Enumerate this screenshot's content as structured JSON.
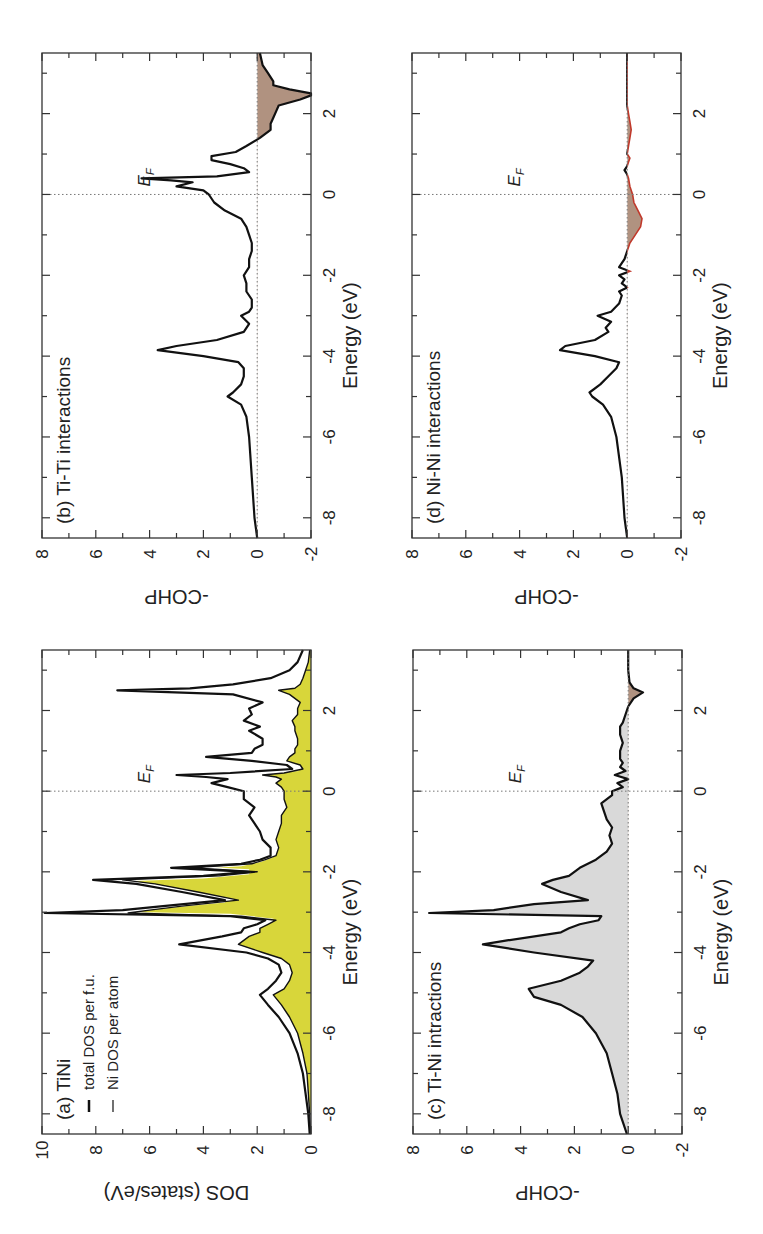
{
  "figure": {
    "colors": {
      "ni_dos_fill": "#d8d63a",
      "tini_cohp_fill": "#d9d9d9",
      "antibonding_fill": "#b09280",
      "antibonding_edge_d": "#c0392b",
      "line": "#111111"
    }
  },
  "chart_data": [
    {
      "id": "a",
      "type": "area",
      "title": "(a) TiNi",
      "xlabel": "Energy (eV)",
      "ylabel": "DOS (states/eV)",
      "xlim": [
        -8.5,
        3.5
      ],
      "ylim": [
        0,
        10
      ],
      "xticks": [
        "-8",
        "-6",
        "-4",
        "-2",
        "0",
        "2"
      ],
      "yticks": [
        "0",
        "2",
        "4",
        "6",
        "8",
        "10"
      ],
      "fermi_label": "E_F",
      "fermi_level": 0,
      "legend": [
        {
          "label": "total DOS per f.u.",
          "style": "thick black line"
        },
        {
          "label": "Ni DOS per atom",
          "style": "thin black line, yellow fill"
        }
      ],
      "series": [
        {
          "name": "total DOS per f.u.",
          "x": [
            -8.5,
            -8,
            -7,
            -6.5,
            -6,
            -5.6,
            -5.3,
            -5.05,
            -4.9,
            -4.7,
            -4.5,
            -4.3,
            -4.15,
            -4.0,
            -3.8,
            -3.6,
            -3.5,
            -3.4,
            -3.3,
            -3.2,
            -3.1,
            -3.02,
            -2.95,
            -2.85,
            -2.7,
            -2.5,
            -2.3,
            -2.2,
            -2.1,
            -2.0,
            -1.9,
            -1.8,
            -1.7,
            -1.6,
            -1.4,
            -1.2,
            -1.0,
            -0.8,
            -0.6,
            -0.4,
            -0.2,
            0,
            0.1,
            0.2,
            0.3,
            0.35,
            0.4,
            0.45,
            0.55,
            0.65,
            0.75,
            0.85,
            0.95,
            1.05,
            1.15,
            1.3,
            1.5,
            1.6,
            1.75,
            1.9,
            2.05,
            2.2,
            2.4,
            2.5,
            2.55,
            2.65,
            2.8,
            3.0,
            3.2,
            3.5
          ],
          "y": [
            0.05,
            0.1,
            0.3,
            0.5,
            0.8,
            1.2,
            1.6,
            1.9,
            1.6,
            1.3,
            1.1,
            1.2,
            1.6,
            2.4,
            4.9,
            3.3,
            2.6,
            2.5,
            2.0,
            1.7,
            3.0,
            9.9,
            7.0,
            5.5,
            3.2,
            4.8,
            6.5,
            8.1,
            4.0,
            2.3,
            5.2,
            2.6,
            1.9,
            1.5,
            1.5,
            1.8,
            1.9,
            2.1,
            2.3,
            2.1,
            2.5,
            2.5,
            3.1,
            3.7,
            3.1,
            3.9,
            5.0,
            3.0,
            0.7,
            0.9,
            2.2,
            3.9,
            2.2,
            2.1,
            1.8,
            1.8,
            2.3,
            1.9,
            2.5,
            2.2,
            2.3,
            1.8,
            2.9,
            7.2,
            4.5,
            2.9,
            1.5,
            0.8,
            0.5,
            0.3
          ]
        },
        {
          "name": "Ni DOS per atom",
          "x": [
            -8.5,
            -8,
            -7,
            -6.5,
            -6,
            -5.6,
            -5.3,
            -5.05,
            -4.9,
            -4.7,
            -4.5,
            -4.3,
            -4.15,
            -4.0,
            -3.8,
            -3.6,
            -3.5,
            -3.4,
            -3.3,
            -3.2,
            -3.1,
            -3.02,
            -2.95,
            -2.85,
            -2.7,
            -2.5,
            -2.3,
            -2.2,
            -2.1,
            -2.0,
            -1.9,
            -1.8,
            -1.7,
            -1.6,
            -1.4,
            -1.2,
            -1.0,
            -0.8,
            -0.6,
            -0.4,
            -0.2,
            0,
            0.1,
            0.2,
            0.3,
            0.35,
            0.4,
            0.45,
            0.55,
            0.65,
            0.75,
            0.85,
            0.95,
            1.05,
            1.15,
            1.3,
            1.5,
            1.6,
            1.75,
            1.9,
            2.05,
            2.2,
            2.4,
            2.5,
            2.55,
            2.65,
            2.8,
            3.0,
            3.2,
            3.5
          ],
          "y": [
            0.02,
            0.05,
            0.15,
            0.3,
            0.5,
            0.8,
            1.1,
            1.4,
            1.0,
            0.8,
            0.7,
            0.8,
            1.1,
            1.8,
            2.7,
            2.3,
            1.9,
            1.9,
            1.6,
            1.3,
            2.6,
            6.8,
            6.0,
            4.8,
            2.7,
            4.2,
            5.8,
            7.0,
            3.4,
            2.0,
            4.5,
            2.2,
            1.7,
            1.3,
            1.2,
            1.3,
            1.2,
            1.1,
            1.1,
            0.9,
            1.0,
            1.0,
            1.1,
            1.3,
            1.1,
            1.3,
            1.8,
            1.0,
            0.3,
            0.4,
            0.9,
            0.8,
            0.6,
            0.6,
            0.5,
            0.5,
            0.6,
            0.6,
            0.7,
            0.5,
            0.5,
            0.4,
            0.8,
            1.2,
            0.6,
            0.4,
            0.3,
            0.2,
            0.1,
            0.05
          ]
        }
      ]
    },
    {
      "id": "b",
      "type": "line",
      "title": "(b) Ti-Ti interactions",
      "xlabel": "Energy (eV)",
      "ylabel": "-COHP",
      "xlim": [
        -8.5,
        3.5
      ],
      "ylim": [
        -2,
        8
      ],
      "xticks": [
        "-8",
        "-6",
        "-4",
        "-2",
        "0",
        "2"
      ],
      "yticks": [
        "-2",
        "0",
        "2",
        "4",
        "6",
        "8"
      ],
      "fermi_label": "E_F",
      "fermi_level": 0,
      "negative_fill": "antibonding region shaded brown",
      "series": [
        {
          "name": "Ti-Ti -COHP",
          "x": [
            -8.5,
            -8,
            -7,
            -6,
            -5.5,
            -5.2,
            -5.0,
            -4.9,
            -4.7,
            -4.5,
            -4.3,
            -4.15,
            -4.0,
            -3.85,
            -3.75,
            -3.6,
            -3.4,
            -3.2,
            -3.0,
            -2.9,
            -2.8,
            -2.6,
            -2.4,
            -2.2,
            -2.0,
            -1.8,
            -1.6,
            -1.4,
            -1.2,
            -1.0,
            -0.8,
            -0.6,
            -0.4,
            -0.2,
            0,
            0.1,
            0.2,
            0.3,
            0.35,
            0.4,
            0.45,
            0.55,
            0.65,
            0.75,
            0.85,
            0.95,
            1.05,
            1.2,
            1.4,
            1.6,
            1.75,
            1.9,
            2.05,
            2.2,
            2.35,
            2.45,
            2.5,
            2.6,
            2.7,
            2.8,
            3.0,
            3.2,
            3.5
          ],
          "y": [
            0.0,
            0.1,
            0.2,
            0.3,
            0.4,
            0.6,
            1.1,
            0.9,
            0.6,
            0.5,
            0.5,
            0.7,
            2.0,
            3.7,
            3.0,
            1.5,
            0.5,
            0.3,
            0.6,
            0.3,
            0.2,
            0.2,
            0.4,
            0.4,
            0.5,
            0.3,
            0.3,
            0.2,
            0.2,
            0.3,
            0.4,
            0.6,
            1.2,
            1.6,
            1.8,
            2.0,
            3.0,
            2.4,
            3.2,
            4.3,
            1.5,
            0.3,
            0.5,
            1.0,
            1.7,
            1.7,
            0.8,
            0.4,
            -0.1,
            -0.5,
            -0.5,
            -0.6,
            -0.7,
            -0.8,
            -1.6,
            -2.0,
            -2.0,
            -1.2,
            -0.6,
            -0.6,
            -0.4,
            -0.2,
            -0.1
          ]
        }
      ]
    },
    {
      "id": "c",
      "type": "area",
      "title": "(c) Ti-Ni intractions",
      "xlabel": "Energy (eV)",
      "ylabel": "-COHP",
      "xlim": [
        -8.5,
        3.5
      ],
      "ylim": [
        -2,
        8
      ],
      "xticks": [
        "-8",
        "-6",
        "-4",
        "-2",
        "0",
        "2"
      ],
      "yticks": [
        "-2",
        "0",
        "2",
        "4",
        "6",
        "8"
      ],
      "fermi_label": "E_F",
      "fermi_level": 0,
      "series": [
        {
          "name": "Ti-Ni -COHP",
          "x": [
            -8.5,
            -8.2,
            -8,
            -7.5,
            -7,
            -6.5,
            -6,
            -5.6,
            -5.3,
            -5.1,
            -4.9,
            -4.7,
            -4.5,
            -4.35,
            -4.2,
            -4.0,
            -3.8,
            -3.7,
            -3.5,
            -3.4,
            -3.3,
            -3.2,
            -3.1,
            -3.02,
            -2.95,
            -2.8,
            -2.7,
            -2.5,
            -2.3,
            -2.2,
            -2.1,
            -2.0,
            -1.9,
            -1.7,
            -1.5,
            -1.3,
            -1.1,
            -0.9,
            -0.7,
            -0.5,
            -0.3,
            -0.1,
            0,
            0.1,
            0.2,
            0.3,
            0.4,
            0.5,
            0.6,
            0.7,
            0.8,
            1.0,
            1.2,
            1.4,
            1.6,
            1.7,
            1.9,
            2.1,
            2.3,
            2.45,
            2.55,
            2.7,
            3.0,
            3.5
          ],
          "y": [
            0.05,
            0.2,
            0.3,
            0.4,
            0.6,
            0.8,
            1.2,
            1.7,
            2.5,
            3.5,
            3.7,
            2.5,
            1.8,
            1.5,
            1.3,
            3.5,
            5.4,
            4.5,
            2.5,
            2.2,
            1.8,
            1.1,
            1.0,
            7.4,
            5.0,
            3.5,
            1.5,
            2.5,
            3.2,
            2.8,
            2.2,
            2.0,
            1.8,
            1.2,
            0.8,
            0.6,
            0.7,
            0.6,
            0.8,
            0.9,
            1.0,
            0.6,
            0.6,
            0.2,
            0.4,
            0.0,
            0.5,
            0.1,
            0.3,
            0.2,
            0.3,
            0.3,
            0.2,
            0.3,
            0.3,
            0.2,
            0.1,
            0.0,
            -0.2,
            -0.55,
            -0.2,
            -0.05,
            0.0,
            0.0
          ]
        }
      ]
    },
    {
      "id": "d",
      "type": "line",
      "title": "(d) Ni-Ni interactions",
      "xlabel": "Energy (eV)",
      "ylabel": "-COHP",
      "xlim": [
        -8.5,
        3.5
      ],
      "ylim": [
        -2,
        8
      ],
      "xticks": [
        "-8",
        "-6",
        "-4",
        "-2",
        "0",
        "2"
      ],
      "yticks": [
        "-2",
        "0",
        "2",
        "4",
        "6",
        "8"
      ],
      "fermi_label": "E_F",
      "fermi_level": 0,
      "negative_fill": "antibonding region shaded brown with red outline",
      "series": [
        {
          "name": "Ni-Ni -COHP",
          "x": [
            -8.5,
            -8,
            -7,
            -6,
            -5.5,
            -5.2,
            -5.0,
            -4.9,
            -4.7,
            -4.5,
            -4.3,
            -4.15,
            -4.0,
            -3.85,
            -3.75,
            -3.6,
            -3.4,
            -3.3,
            -3.15,
            -3.0,
            -2.9,
            -2.7,
            -2.5,
            -2.4,
            -2.3,
            -2.2,
            -2.1,
            -2.0,
            -1.9,
            -1.8,
            -1.6,
            -1.4,
            -1.2,
            -1.0,
            -0.8,
            -0.6,
            -0.4,
            -0.2,
            0,
            0.2,
            0.4,
            0.5,
            0.6,
            0.7,
            0.8,
            0.9,
            1.0,
            1.2,
            1.4,
            1.6,
            1.8,
            2.0,
            2.2,
            2.4,
            2.6,
            3.0,
            3.5
          ],
          "y": [
            0.0,
            0.1,
            0.2,
            0.4,
            0.6,
            0.9,
            1.3,
            1.4,
            1.0,
            0.7,
            0.4,
            0.3,
            1.2,
            2.5,
            2.3,
            1.2,
            0.7,
            0.8,
            0.6,
            1.1,
            0.6,
            0.3,
            0.2,
            0.3,
            0.0,
            0.2,
            0.1,
            0.3,
            -0.1,
            0.3,
            0.1,
            0.0,
            -0.1,
            -0.3,
            -0.5,
            -0.55,
            -0.4,
            -0.25,
            -0.2,
            -0.1,
            -0.05,
            0.0,
            0.1,
            0.0,
            -0.05,
            -0.1,
            0.0,
            -0.05,
            -0.1,
            -0.15,
            -0.1,
            -0.05,
            0.0,
            0.0,
            0.0,
            0.0,
            0.0
          ]
        }
      ]
    }
  ]
}
